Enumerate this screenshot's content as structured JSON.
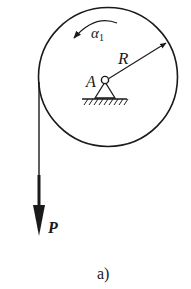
{
  "figure": {
    "caption": "a)",
    "labels": {
      "angular_acceleration": "α",
      "angular_acceleration_sub": "1",
      "radius": "R",
      "pivot": "A",
      "force": "P"
    },
    "colors": {
      "stroke": "#1a1a1a",
      "background": "#ffffff"
    }
  }
}
